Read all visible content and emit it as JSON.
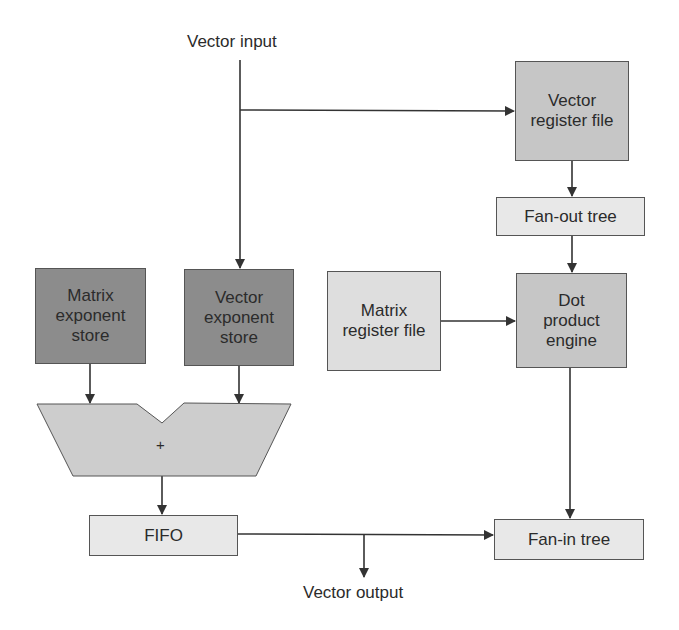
{
  "diagram": {
    "labels": {
      "vector_input": "Vector input",
      "vector_output": "Vector output",
      "adder_symbol": "+"
    },
    "blocks": {
      "vector_register_file": "Vector register file",
      "fan_out_tree": "Fan-out tree",
      "matrix_exponent_store": "Matrix exponent store",
      "vector_exponent_store": "Vector exponent store",
      "matrix_register_file": "Matrix register file",
      "dot_product_engine": "Dot product engine",
      "fifo": "FIFO",
      "fan_in_tree": "Fan-in tree"
    },
    "colors": {
      "dark_fill": "#8c8c8c",
      "medium_fill": "#c6c6c6",
      "light_fill": "#dedede",
      "lightest_fill": "#e8e8e8",
      "adder_fill": "#cdcdcd",
      "line": "#333333"
    },
    "connections": [
      {
        "from": "Vector input",
        "to": "Vector register file"
      },
      {
        "from": "Vector input",
        "to": "Vector exponent store"
      },
      {
        "from": "Vector register file",
        "to": "Fan-out tree"
      },
      {
        "from": "Fan-out tree",
        "to": "Dot product engine"
      },
      {
        "from": "Matrix register file",
        "to": "Dot product engine"
      },
      {
        "from": "Dot product engine",
        "to": "Fan-in tree"
      },
      {
        "from": "Matrix exponent store",
        "to": "Adder"
      },
      {
        "from": "Vector exponent store",
        "to": "Adder"
      },
      {
        "from": "Adder",
        "to": "FIFO"
      },
      {
        "from": "FIFO",
        "to": "Fan-in tree"
      },
      {
        "from": "FIFO",
        "to": "Vector output"
      }
    ]
  }
}
